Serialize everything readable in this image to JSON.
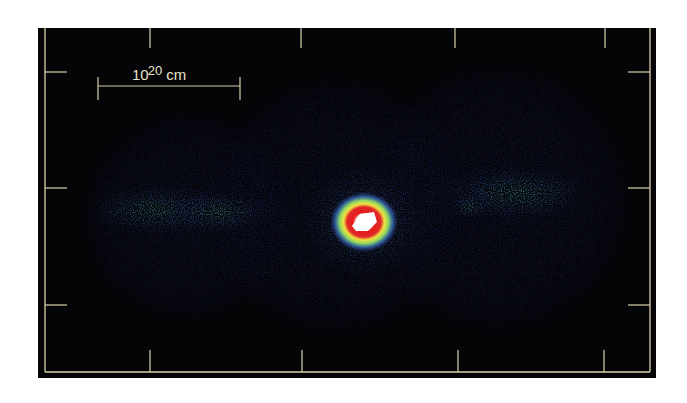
{
  "figure": {
    "background": "#050508",
    "frame_color": "#d9d0a8",
    "scale_bar": {
      "base": "10",
      "exponent": "20",
      "unit": "cm",
      "x1": 60,
      "x2": 202,
      "y": 58
    },
    "ticks": {
      "top_x": [
        112,
        263,
        417,
        567
      ],
      "bottom_x": [
        112,
        264,
        420,
        566
      ],
      "left_y": [
        44,
        160,
        277
      ],
      "right_y": [
        44,
        160,
        277
      ]
    },
    "lobes": [
      {
        "name": "left-lobe",
        "cx": 150,
        "cy": 188,
        "r": 104
      },
      {
        "name": "center-lobe",
        "cx": 297,
        "cy": 178,
        "r": 128
      },
      {
        "name": "right-lobe",
        "cx": 460,
        "cy": 170,
        "r": 133
      }
    ],
    "hot_spot": {
      "cx": 326,
      "cy": 194
    },
    "colormap": [
      "#0a0a30",
      "#2a2f8a",
      "#3d6fc0",
      "#3fb8a0",
      "#8fd860",
      "#f0e040",
      "#e02020",
      "#ffffff"
    ]
  }
}
